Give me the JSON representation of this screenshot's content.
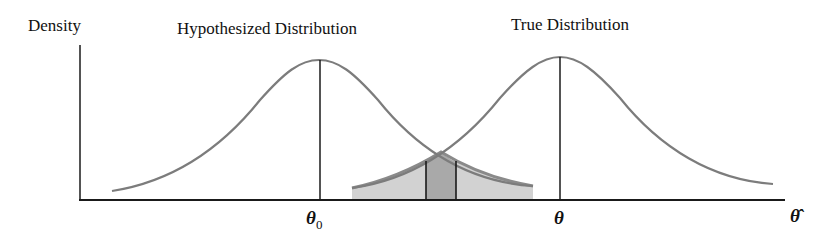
{
  "figure": {
    "y_axis_label": "Density",
    "curves": [
      {
        "name": "hypothesized",
        "label": "Hypothesized Distribution",
        "center_symbol": "θ0",
        "center_symbol_base": "θ",
        "center_symbol_sub": "0"
      },
      {
        "name": "true",
        "label": "True Distribution",
        "center_symbol": "θ"
      }
    ],
    "x_axis_label": "θ̂",
    "shaded_region": {
      "description": "Overlapping tails of both distributions shaded; middle band between two vertical lines shaded darker"
    },
    "colors": {
      "curve": "#7a7a7a",
      "axis": "#1a1a1a",
      "shade_light": "#d4d4d4",
      "shade_dark": "#a8a8a8"
    }
  }
}
